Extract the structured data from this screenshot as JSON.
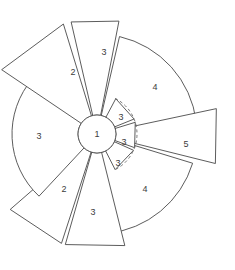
{
  "figure": {
    "name": "radial-sector-diagram",
    "background_color": "#ffffff",
    "stroke_color": "#4a4a4a",
    "label_color": "#3c3c3c",
    "guide_color": "#6a6a6a",
    "center": {
      "x": 97,
      "y": 134
    },
    "hub": {
      "label": "1",
      "radius": 19
    },
    "guide_arc": {
      "label": "dashed-reference-arc",
      "radius": 40,
      "start_angle": -63,
      "end_angle": 63,
      "dashed": true
    }
  },
  "chart_data": {
    "type": "pie",
    "title": "",
    "subtitle": "",
    "xlabel": "",
    "ylabel": "",
    "grid": false,
    "legend": "none",
    "center_value": 1,
    "radius_scale": {
      "1": 19,
      "2": 115,
      "3": 40,
      "4": 100,
      "5": 122
    },
    "categories": [
      "3",
      "4",
      "5",
      "4",
      "3",
      "2",
      "3",
      "2",
      "3",
      "3",
      "3"
    ],
    "values": [
      3,
      4,
      5,
      4,
      3,
      2,
      3,
      2,
      3,
      3,
      3
    ],
    "sectors": [
      {
        "id": "sector-top-3",
        "label": "3",
        "value": 3,
        "start_angle": -103,
        "end_angle": -79,
        "inner_radius": 19,
        "outer_radius": 115,
        "outer_shape": "flat",
        "label_x": 104,
        "label_y": 53
      },
      {
        "id": "sector-upper-right-4",
        "label": "4",
        "value": 4,
        "start_angle": -77,
        "end_angle": -7,
        "inner_radius": 19,
        "outer_radius": 100,
        "outer_shape": "arc",
        "label_x": 155,
        "label_y": 88
      },
      {
        "id": "sector-right-5",
        "label": "5",
        "value": 5,
        "start_angle": -12,
        "end_angle": 14,
        "inner_radius": 19,
        "outer_radius": 122,
        "outer_shape": "flat",
        "label_x": 186,
        "label_y": 145
      },
      {
        "id": "sector-lower-right-4",
        "label": "4",
        "value": 4,
        "start_angle": 17,
        "end_angle": 84,
        "inner_radius": 19,
        "outer_radius": 100,
        "outer_shape": "arc",
        "label_x": 145,
        "label_y": 190
      },
      {
        "id": "sector-bottom-3",
        "label": "3",
        "value": 3,
        "start_angle": 76,
        "end_angle": 106,
        "inner_radius": 19,
        "outer_radius": 115,
        "outer_shape": "flat",
        "label_x": 93,
        "label_y": 213
      },
      {
        "id": "sector-lower-left-2",
        "label": "2",
        "value": 2,
        "start_angle": 108,
        "end_angle": 139,
        "inner_radius": 19,
        "outer_radius": 115,
        "outer_shape": "flat",
        "label_x": 64,
        "label_y": 190
      },
      {
        "id": "sector-left-3",
        "label": "3",
        "value": 3,
        "start_angle": 133,
        "end_angle": 221,
        "inner_radius": 19,
        "outer_radius": 85,
        "outer_shape": "arc",
        "label_x": 39,
        "label_y": 137
      },
      {
        "id": "sector-upper-left-2",
        "label": "2",
        "value": 2,
        "start_angle": -146,
        "end_angle": -107,
        "inner_radius": 19,
        "outer_radius": 115,
        "outer_shape": "flat",
        "label_x": 73,
        "label_y": 73
      },
      {
        "id": "sector-inner-upper-3",
        "label": "3",
        "value": 3,
        "start_angle": -62,
        "end_angle": -22,
        "inner_radius": 19,
        "outer_radius": 40,
        "outer_shape": "flat",
        "label_x": 121,
        "label_y": 118
      },
      {
        "id": "sector-inner-middle-3",
        "label": "3",
        "value": 3,
        "start_angle": -17,
        "end_angle": 20,
        "inner_radius": 19,
        "outer_radius": 40,
        "outer_shape": "flat",
        "label_x": 124,
        "label_y": 143
      },
      {
        "id": "sector-inner-lower-3",
        "label": "3",
        "value": 3,
        "start_angle": 24,
        "end_angle": 63,
        "inner_radius": 19,
        "outer_radius": 40,
        "outer_shape": "flat",
        "label_x": 118,
        "label_y": 164
      }
    ]
  }
}
